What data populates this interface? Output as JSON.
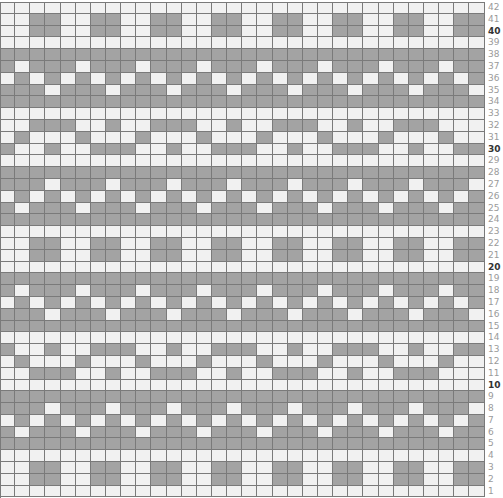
{
  "chart": {
    "columns": 32,
    "legend": {
      "dark": "#a3a3a3",
      "light": "#f1f1f1",
      "grid": "#7a7a7a"
    },
    "bold_row_numbers": [
      10,
      20,
      30,
      40
    ],
    "rows": [
      {
        "n": "42",
        "cells": "................................"
      },
      {
        "n": "41",
        "cells": "..DD..DD..DD..DD..DD..DD..DD..DD"
      },
      {
        "n": "40",
        "cells": "..DD..DD..DD..DD..DD..DD..DD..DD"
      },
      {
        "n": "39",
        "cells": "................................"
      },
      {
        "n": "38",
        "cells": "DDDDDDDDDDDDDDDDDDDDDDDDDDDDDDDD"
      },
      {
        "n": "37",
        "cells": "D.DDD.DDD.DDD.DDD.DDD.DDD.DDD.DD"
      },
      {
        "n": "36",
        "cells": ".D.D.D.D.D.D.D.D.D.D.D.D.D.D.D.D"
      },
      {
        "n": "35",
        "cells": "DDD.DDD.DDD.DDD.DDD.DDD.DDD.DDD."
      },
      {
        "n": "34",
        "cells": "DDDDDDDDDDDDDDDDDDDDDDDDDDDDDDDD"
      },
      {
        "n": "33",
        "cells": "................................"
      },
      {
        "n": "32",
        "cells": "..DDD..D..DDD..D..DDD..D..DDD..."
      },
      {
        "n": "31",
        "cells": ".D...D...D...D...D...D...D...D.."
      },
      {
        "n": "30",
        "cells": "D..D..DDD..D..DDD..D..DDD..D..DD"
      },
      {
        "n": "29",
        "cells": "................................"
      },
      {
        "n": "28",
        "cells": "DDDDDDDDDDDDDDDDDDDDDDDDDDDDDDDD"
      },
      {
        "n": "27",
        "cells": "DDD.DDD.DDD.DDD.DDD.DDD.DDD.DDD."
      },
      {
        "n": "26",
        "cells": ".D.D.D.D.D.D.D.D.D.D.D.D.D.D.D.D"
      },
      {
        "n": "25",
        "cells": "D.DDD.DDD.DDD.DDD.DDD.DDD.DDD.DD"
      },
      {
        "n": "24",
        "cells": "DDDDDDDDDDDDDDDDDDDDDDDDDDDDDDDD"
      },
      {
        "n": "23",
        "cells": "................................"
      },
      {
        "n": "22",
        "cells": "..DD..DD..DD..DD..DD..DD..DD..DD"
      },
      {
        "n": "21",
        "cells": "..DD..DD..DD..DD..DD..DD..DD..DD"
      },
      {
        "n": "20",
        "cells": "................................"
      },
      {
        "n": "19",
        "cells": "DDDDDDDDDDDDDDDDDDDDDDDDDDDDDDDD"
      },
      {
        "n": "18",
        "cells": "D.DDD.DDD.DDD.DDD.DDD.DDD.DDD.DD"
      },
      {
        "n": "17",
        "cells": ".D.D.D.D.D.D.D.D.D.D.D.D.D.D.D.D"
      },
      {
        "n": "16",
        "cells": "DDD.DDD.DDD.DDD.DDD.DDD.DDD.DDD."
      },
      {
        "n": "15",
        "cells": "DDDDDDDDDDDDDDDDDDDDDDDDDDDDDDDD"
      },
      {
        "n": "14",
        "cells": "................................"
      },
      {
        "n": "13",
        "cells": "D..D..DDD..D..DDD..D..DDD..D..DD"
      },
      {
        "n": "12",
        "cells": ".D...D...D...D...D...D...D...D.."
      },
      {
        "n": "11",
        "cells": "..DDD..D..DDD..D..DDD..D..DDD..."
      },
      {
        "n": "10",
        "cells": "................................"
      },
      {
        "n": "9",
        "cells": "DDDDDDDDDDDDDDDDDDDDDDDDDDDDDDDD"
      },
      {
        "n": "8",
        "cells": "DDD.DDD.DDD.DDD.DDD.DDD.DDD.DDD."
      },
      {
        "n": "7",
        "cells": ".D.D.D.D.D.D.D.D.D.D.D.D.D.D.D.D"
      },
      {
        "n": "6",
        "cells": "D.DDD.DDD.DDD.DDD.DDD.DDD.DDD.DD"
      },
      {
        "n": "5",
        "cells": "DDDDDDDDDDDDDDDDDDDDDDDDDDDDDDDD"
      },
      {
        "n": "4",
        "cells": "................................"
      },
      {
        "n": "3",
        "cells": "..DD..DD..DD..DD..DD..DD..DD..DD"
      },
      {
        "n": "2",
        "cells": "..DD..DD..DD..DD..DD..DD..DD..DD"
      },
      {
        "n": "1",
        "cells": "................................"
      }
    ]
  }
}
